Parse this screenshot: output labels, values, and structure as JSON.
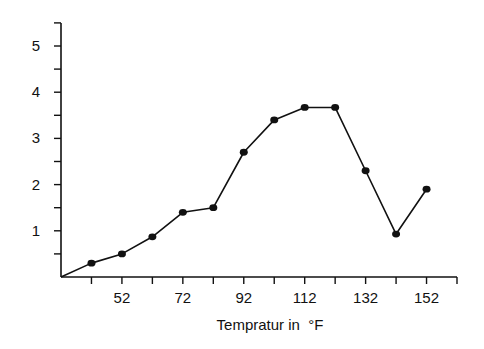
{
  "chart_data": {
    "type": "line",
    "title": "",
    "xlabel": "Tempratur in  °F",
    "ylabel": "",
    "x": [
      42,
      52,
      62,
      72,
      82,
      92,
      102,
      112,
      122,
      132,
      142,
      152
    ],
    "series": [
      {
        "name": "series-1",
        "values": [
          0.3,
          0.5,
          0.87,
          1.4,
          1.5,
          2.7,
          3.4,
          3.67,
          3.67,
          2.3,
          0.93,
          1.9
        ],
        "color": "#111111",
        "markers": true
      }
    ],
    "line_start": {
      "x": 32,
      "y": 0
    },
    "xlim": [
      32,
      162
    ],
    "ylim": [
      0,
      5.5
    ],
    "x_ticks": [
      42,
      52,
      62,
      72,
      82,
      92,
      102,
      112,
      122,
      132,
      142,
      152,
      162
    ],
    "x_tick_labels": [
      {
        "value": 52,
        "label": "52"
      },
      {
        "value": 72,
        "label": "72"
      },
      {
        "value": 92,
        "label": "92"
      },
      {
        "value": 112,
        "label": "112"
      },
      {
        "value": 132,
        "label": "132"
      },
      {
        "value": 152,
        "label": "152"
      }
    ],
    "y_ticks": [
      0.5,
      1,
      1.5,
      2,
      2.5,
      3,
      3.5,
      4,
      4.5,
      5,
      5.5
    ],
    "y_tick_labels": [
      {
        "value": 1,
        "label": "1"
      },
      {
        "value": 2,
        "label": "2"
      },
      {
        "value": 3,
        "label": "3"
      },
      {
        "value": 4,
        "label": "4"
      },
      {
        "value": 5,
        "label": "5"
      }
    ],
    "grid": false,
    "legend": null
  }
}
